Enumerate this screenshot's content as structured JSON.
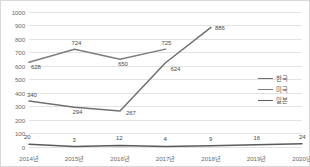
{
  "chart_data": {
    "type": "line",
    "title": "",
    "xlabel": "",
    "ylabel": "",
    "ylim": [
      0,
      1000
    ],
    "ytick_step": 100,
    "grid": true,
    "legend_position": "right",
    "categories": [
      "2014년",
      "2015년",
      "2016년",
      "2017년",
      "2018년",
      "2019년",
      "2020년"
    ],
    "ytick_labels": [
      "1000",
      "900",
      "800",
      "700",
      "600",
      "500",
      "400",
      "300",
      "200",
      "100",
      "0"
    ],
    "series": [
      {
        "name": "한국",
        "color": "#707070",
        "values": [
          340,
          294,
          267,
          624,
          886,
          null,
          null
        ],
        "labels": [
          "340",
          "294",
          "267",
          "624",
          "886",
          "",
          ""
        ]
      },
      {
        "name": "미국",
        "color": "#7d7d7d",
        "values": [
          628,
          724,
          650,
          725,
          null,
          null,
          null
        ],
        "labels": [
          "628",
          "724",
          "650",
          "725",
          "",
          "",
          ""
        ]
      },
      {
        "name": "일본",
        "color": "#5a5a5a",
        "values": [
          20,
          3,
          12,
          4,
          9,
          16,
          24
        ],
        "labels": [
          "20",
          "3",
          "12",
          "4",
          "9",
          "16",
          "24"
        ]
      }
    ]
  },
  "legend": {
    "items": [
      {
        "label": "한국"
      },
      {
        "label": "미국"
      },
      {
        "label": "일본"
      }
    ]
  },
  "colors": {
    "grid": "#e3e3e3",
    "axis_text": "#6b6b6b",
    "data_label": "#4a4a4a",
    "border": "#d9d9d9"
  }
}
